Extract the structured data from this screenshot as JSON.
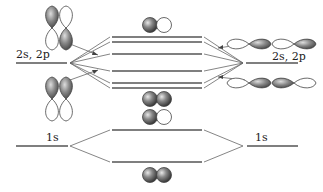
{
  "diagram": {
    "type": "molecular-orbital-energy-diagram",
    "labels": {
      "left_valence": "2s, 2p",
      "right_valence": "2s, 2p",
      "left_core": "1s",
      "right_core": "1s"
    },
    "colors": {
      "line": "#555555",
      "orbital_shade": "#777777",
      "orbital_outline": "#444444"
    },
    "valence_mo_levels": 6,
    "core_mo_levels": 2
  }
}
